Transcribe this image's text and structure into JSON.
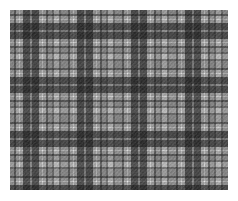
{
  "image": {
    "title": "Grayscale Plaid Tartan Fabric Swatch",
    "kind": "textile-pattern",
    "width": 238,
    "height": 201,
    "background_color": "#ffffff"
  },
  "swatch": {
    "name": "plaid-swatch",
    "offset_x": 10,
    "offset_y": 10,
    "width": 218,
    "height": 180,
    "base_color": "#b4b4b4"
  },
  "palette": {
    "white_accent": "#f2f2f2",
    "pale": "#d8d8d8",
    "light": "#c2c2c2",
    "base": "#b0b0b0",
    "medium": "#9a9a9a",
    "mid_dark": "#7e7e7e",
    "dark": "#616161",
    "deep": "#4a4a4a",
    "darkest": "#383838"
  },
  "pattern": {
    "type": "tartan-plaid",
    "symmetry": "balanced-sett",
    "repeat_px": 54,
    "warp_weft_same": true,
    "noise_amount": 0.05,
    "sett": [
      {
        "color_key": "base",
        "width": 4
      },
      {
        "color_key": "dark",
        "width": 2
      },
      {
        "color_key": "light",
        "width": 3
      },
      {
        "color_key": "white_accent",
        "width": 1
      },
      {
        "color_key": "light",
        "width": 3
      },
      {
        "color_key": "deep",
        "width": 7
      },
      {
        "color_key": "medium",
        "width": 2
      },
      {
        "color_key": "deep",
        "width": 7
      },
      {
        "color_key": "light",
        "width": 3
      },
      {
        "color_key": "white_accent",
        "width": 1
      },
      {
        "color_key": "light",
        "width": 3
      },
      {
        "color_key": "dark",
        "width": 2
      },
      {
        "color_key": "base",
        "width": 4
      },
      {
        "color_key": "mid_dark",
        "width": 2
      },
      {
        "color_key": "pale",
        "width": 5
      },
      {
        "color_key": "mid_dark",
        "width": 2
      },
      {
        "color_key": "base",
        "width": 3
      }
    ]
  }
}
